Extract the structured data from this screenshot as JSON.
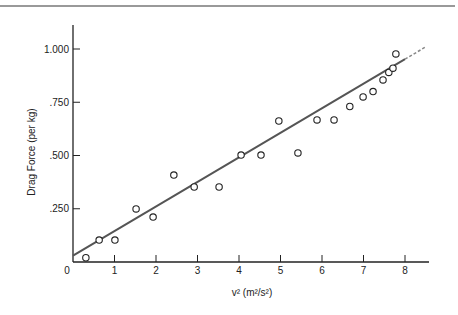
{
  "chart_data": {
    "type": "scatter",
    "title": "",
    "xlabel": "v² (m²/s²)",
    "ylabel": "Drag Force (per kg)",
    "xlim": [
      0,
      8.6
    ],
    "ylim": [
      0,
      1.1
    ],
    "grid": false,
    "legend": null,
    "x_ticks": [
      0,
      1,
      2,
      3,
      4,
      5,
      6,
      7,
      8
    ],
    "x_tick_labels": [
      "0",
      "1",
      "2",
      "3",
      "4",
      "5",
      "6",
      "7",
      "8"
    ],
    "y_ticks": [
      0.25,
      0.5,
      0.75,
      1.0
    ],
    "y_tick_labels": [
      ".250",
      ".500",
      ".750",
      "1.000"
    ],
    "series": [
      {
        "name": "measurements",
        "marker": "open-circle",
        "x": [
          0.31,
          0.63,
          1.01,
          1.52,
          1.93,
          2.43,
          2.92,
          3.52,
          4.05,
          4.53,
          4.96,
          5.42,
          5.88,
          6.29,
          6.67,
          6.99,
          7.23,
          7.47,
          7.61,
          7.71,
          7.78
        ],
        "y": [
          0.02,
          0.103,
          0.103,
          0.249,
          0.211,
          0.408,
          0.352,
          0.352,
          0.502,
          0.502,
          0.662,
          0.512,
          0.667,
          0.667,
          0.73,
          0.775,
          0.8,
          0.855,
          0.89,
          0.91,
          0.977
        ]
      }
    ],
    "fit_line": {
      "name": "linear fit",
      "x": [
        0,
        8.5
      ],
      "y": [
        0.03,
        1.01
      ],
      "solid_until_x": 8.0,
      "dashed_after_x": 8.0,
      "color": "#555555"
    }
  },
  "colors": {
    "axis": "#222222",
    "marker": "#222222",
    "fit_line": "#555555",
    "top_rule": "#777777"
  }
}
